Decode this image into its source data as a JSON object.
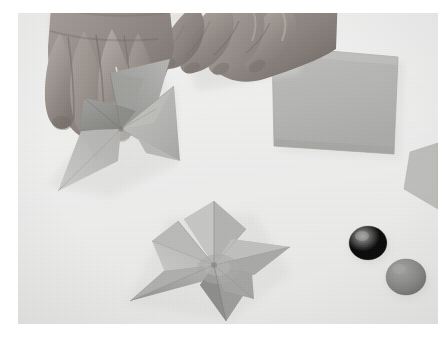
{
  "scene": {
    "title": "Hands folding paper pinwheels",
    "description": "Overhead photograph of two hands folding a gray paper pinwheel on a white surface, with a finished pinwheel, a square sheet of gray paper and two balls of modelling clay",
    "capture_style": "grayscale-photograph",
    "background_color": "#f1f1f0",
    "photo_frame": {
      "x": 18,
      "y": 13,
      "width": 420,
      "height": 311
    }
  },
  "palette": {
    "background": "#f1f1f0",
    "background_shadow": "#e4e4e2",
    "paper_light": "#c6c6c4",
    "paper_mid": "#b4b4b2",
    "paper_dark": "#9c9c9a",
    "paper_darkest": "#878785",
    "skin_light": "#b9b2ad",
    "skin_mid": "#9b938e",
    "skin_dark": "#7d7570",
    "skin_shadow": "#655e5a",
    "clay_light": "#9a9a98",
    "clay_mid": "#878785",
    "clay_dark": "#6e6e6c",
    "white_frame": "#ffffff"
  },
  "objects": [
    {
      "id": "left-hand",
      "label": "Left hand",
      "role": "holding the pinwheel being folded",
      "center": {
        "x": 78,
        "y": 68
      },
      "fingers": 4
    },
    {
      "id": "right-hand",
      "label": "Right hand",
      "role": "resting beside the pinwheel",
      "center": {
        "x": 210,
        "y": 45
      },
      "fingers": 4
    },
    {
      "id": "pinwheel-in-progress",
      "label": "Pinwheel being folded",
      "center": {
        "x": 103,
        "y": 116
      },
      "blades": 4,
      "state": "in-progress"
    },
    {
      "id": "pinwheel-finished",
      "label": "Finished pinwheel",
      "center": {
        "x": 196,
        "y": 252
      },
      "blades": 4,
      "state": "finished"
    },
    {
      "id": "paper-square",
      "label": "Square sheet of paper",
      "center": {
        "x": 332,
        "y": 94
      },
      "width": 120,
      "height": 104,
      "rotation_deg": -2
    },
    {
      "id": "paper-edge-right",
      "label": "Partially visible sheet of paper at right edge",
      "center": {
        "x": 428,
        "y": 158
      }
    },
    {
      "id": "clay-ball-upper",
      "label": "Ball of modelling clay",
      "center": {
        "x": 368,
        "y": 243
      },
      "radius_x": 19,
      "radius_y": 17
    },
    {
      "id": "clay-ball-lower",
      "label": "Ball of modelling clay",
      "center": {
        "x": 406,
        "y": 276
      },
      "radius_x": 20,
      "radius_y": 18
    }
  ]
}
